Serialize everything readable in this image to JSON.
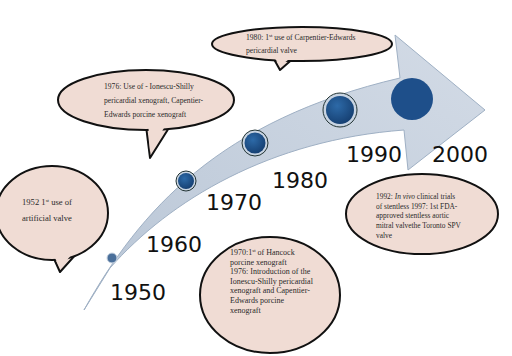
{
  "diagram": {
    "type": "timeline",
    "colors": {
      "arrow_fill": "#c9d3e0",
      "arrow_stroke": "#9fb0c4",
      "milestone_fill": "#1e4f8a",
      "milestone_ring": "#c8d4e2",
      "bubble_fill": "#f0dcd4",
      "bubble_stroke": "#111111",
      "year_text": "#111111"
    },
    "years": [
      {
        "label": "1950"
      },
      {
        "label": "1960"
      },
      {
        "label": "1970"
      },
      {
        "label": "1980"
      },
      {
        "label": "1990"
      },
      {
        "label": "2000"
      }
    ],
    "milestones": [
      {
        "name": "milestone-1950"
      },
      {
        "name": "milestone-1960"
      },
      {
        "name": "milestone-1970"
      },
      {
        "name": "milestone-1980"
      },
      {
        "name": "milestone-2000"
      }
    ],
    "callouts": {
      "c1952": {
        "year": "1952",
        "sup": "st",
        "line1_rest": " use of",
        "line2": "artificial valve"
      },
      "c1976": {
        "line1": "1976: Use of - Ionescu-Shilly",
        "line2": "pericardial xenograft, Capentier-",
        "line3": "Edwards porcine xenograft"
      },
      "c1980": {
        "line1_pre": "1980: 1",
        "sup": "st",
        "line1_rest": " use of Carpentier-Edwards",
        "line2": "pericardial valve"
      },
      "c1970": {
        "line1_pre": "1970:1",
        "sup": "st",
        "line1_rest": " of Hancock",
        "line2": "porcine xenograft",
        "line3": "1976: Introduction of the",
        "line4": "Ionescu-Shilly pericardial",
        "line5": "xenograft and Capentier-",
        "line6": "Edwards porcine",
        "line7": "xenograft"
      },
      "c1992": {
        "line1_pre": "1992: ",
        "line1_italic": "In vivo",
        "line1_rest": " clinical trials",
        "line2": "of stentless 1997: 1st FDA-",
        "line3": "approved stentless aortic",
        "line4": "mitral valvethe Toronto SPV",
        "line5": "valve"
      }
    }
  }
}
